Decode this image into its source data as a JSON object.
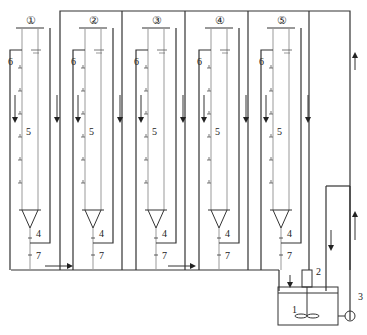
{
  "diagram": {
    "columns": [
      {
        "id": "1",
        "label": "①",
        "x": 30
      },
      {
        "id": "2",
        "label": "②",
        "x": 93
      },
      {
        "id": "3",
        "label": "③",
        "x": 156
      },
      {
        "id": "4",
        "label": "④",
        "x": 219
      },
      {
        "id": "5",
        "label": "⑤",
        "x": 281
      }
    ],
    "labels": {
      "tank": "1",
      "motor": "2",
      "pump": "3",
      "outlet": "4",
      "column_body": "5",
      "sampling_port": "6",
      "valve": "7"
    },
    "colors": {
      "line": "#333333",
      "light_line": "#999999"
    }
  }
}
